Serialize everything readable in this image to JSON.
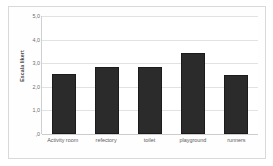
{
  "chart_data": {
    "type": "bar",
    "title": "",
    "subtitle": "",
    "xlabel": "",
    "ylabel": "Escala likert",
    "categories": [
      "Activity room",
      "refectory",
      "toilet",
      "playground",
      "runners"
    ],
    "values": [
      2.55,
      2.85,
      2.85,
      3.45,
      2.5
    ],
    "series": [
      {
        "name": "Escala likert",
        "values": [
          2.55,
          2.85,
          2.85,
          3.45,
          2.5
        ]
      }
    ],
    "ylim": [
      0,
      5
    ],
    "xlim": null,
    "ytick_labels": [
      "5,0",
      "4,0",
      "3,0",
      "2,0",
      "1,0",
      ",0"
    ],
    "ytick_values": [
      5,
      4,
      3,
      2,
      1,
      0
    ],
    "grid": "horizontal",
    "legend": "none",
    "bar_color": "#2b2b2b",
    "bar_edge_color": "#1b1b1b",
    "gridline_color": "#e2e2e2",
    "axis_color": "#cfcfcf",
    "plot_background": "#ffffff",
    "frame_color": "#d9d9d9",
    "tick_label_color": "#6d6d6d"
  }
}
